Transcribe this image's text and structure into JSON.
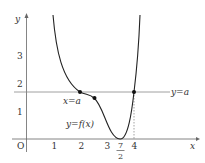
{
  "diagram": {
    "axes": {
      "x_label": "x",
      "y_label": "y",
      "origin_label": "O",
      "x_ticks": [
        "1",
        "2",
        "3",
        "4"
      ],
      "y_ticks": [
        "1",
        "2",
        "3"
      ],
      "x_special_tick": {
        "numerator": "7",
        "denominator": "2"
      }
    },
    "curve_label": "y=f(x)",
    "line_label": "y=a",
    "point_label": "x=a",
    "colors": {
      "curve": "#222222",
      "axis": "#555555",
      "line": "#777777",
      "text": "#333333"
    }
  }
}
